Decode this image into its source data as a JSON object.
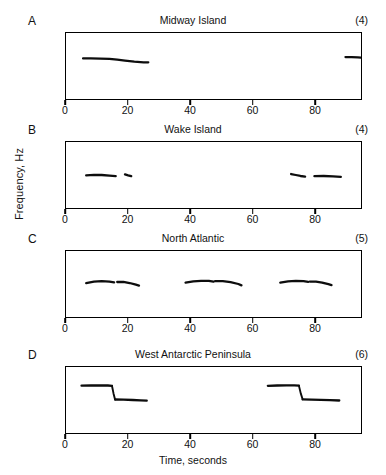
{
  "figure": {
    "y_axis_label": "Frequency, Hz",
    "x_axis_label": "Time, seconds",
    "y_ticks": [
      "0",
      "10",
      "20",
      "30",
      "40"
    ],
    "x_ticks": [
      "0",
      "20",
      "40",
      "60",
      "80"
    ],
    "panels": [
      {
        "letter": "A",
        "title": "Midway Island",
        "count": "(4)"
      },
      {
        "letter": "B",
        "title": "Wake Island",
        "count": "(4)"
      },
      {
        "letter": "C",
        "title": "North Atlantic",
        "count": "(5)"
      },
      {
        "letter": "D",
        "title": "West Antarctic Peninsula",
        "count": "(6)"
      }
    ]
  },
  "chart_data": [
    {
      "type": "line",
      "title": "Midway Island",
      "panel": "A",
      "annotation": "(4)",
      "xlabel": "Time, seconds",
      "ylabel": "Frequency, Hz",
      "xlim": [
        0,
        95
      ],
      "ylim": [
        0,
        40
      ],
      "xticks": [
        0,
        20,
        40,
        60,
        80
      ],
      "yticks": [
        0,
        10,
        20,
        30,
        40
      ],
      "grid": false,
      "legend": "none",
      "series": [
        {
          "name": "call-1",
          "x": [
            5.5,
            8.0,
            11.0,
            14.0,
            16.5,
            19.0,
            22.0,
            25.0,
            26.5
          ],
          "y": [
            24.6,
            24.6,
            24.5,
            24.3,
            23.8,
            23.2,
            22.6,
            22.2,
            22.2
          ]
        },
        {
          "name": "call-2",
          "x": [
            90.0,
            92.0,
            94.0,
            95.0
          ],
          "y": [
            25.4,
            25.4,
            25.2,
            25.1
          ]
        }
      ]
    },
    {
      "type": "line",
      "title": "Wake Island",
      "panel": "B",
      "annotation": "(4)",
      "xlabel": "Time, seconds",
      "ylabel": "Frequency, Hz",
      "xlim": [
        0,
        95
      ],
      "ylim": [
        0,
        40
      ],
      "xticks": [
        0,
        20,
        40,
        60,
        80
      ],
      "yticks": [
        0,
        10,
        20,
        30,
        40
      ],
      "grid": false,
      "legend": "none",
      "series": [
        {
          "name": "call-1",
          "x": [
            6.5,
            9.0,
            11.5,
            14.0,
            16.0
          ],
          "y": [
            19.8,
            20.1,
            20.0,
            19.6,
            19.3
          ]
        },
        {
          "name": "call-2",
          "x": [
            19.0,
            20.0,
            21.0
          ],
          "y": [
            20.4,
            19.8,
            19.3
          ]
        },
        {
          "name": "call-3",
          "x": [
            72.5,
            74.0,
            75.5,
            77.0
          ],
          "y": [
            20.6,
            20.0,
            19.4,
            19.0
          ]
        },
        {
          "name": "call-4",
          "x": [
            80.0,
            83.0,
            86.0,
            88.5
          ],
          "y": [
            19.3,
            19.4,
            19.2,
            18.9
          ]
        }
      ]
    },
    {
      "type": "line",
      "title": "North Atlantic",
      "panel": "C",
      "annotation": "(5)",
      "xlabel": "Time, seconds",
      "ylabel": "Frequency, Hz",
      "xlim": [
        0,
        95
      ],
      "ylim": [
        0,
        40
      ],
      "xticks": [
        0,
        20,
        40,
        60,
        80
      ],
      "yticks": [
        0,
        10,
        20,
        30,
        40
      ],
      "grid": false,
      "legend": "none",
      "series": [
        {
          "name": "call-1a",
          "x": [
            6.5,
            9.0,
            11.5,
            14.0,
            15.5
          ],
          "y": [
            20.6,
            21.4,
            21.7,
            21.5,
            21.0
          ]
        },
        {
          "name": "call-1b",
          "x": [
            16.5,
            18.5,
            20.5,
            22.5,
            23.5
          ],
          "y": [
            21.2,
            21.3,
            20.6,
            19.6,
            19.0
          ]
        },
        {
          "name": "call-2a",
          "x": [
            38.5,
            41.0,
            43.5,
            46.0,
            47.5
          ],
          "y": [
            20.8,
            21.6,
            21.9,
            21.9,
            21.4
          ]
        },
        {
          "name": "call-2b",
          "x": [
            48.0,
            50.5,
            53.0,
            55.5,
            56.5
          ],
          "y": [
            21.7,
            21.7,
            21.1,
            20.0,
            19.2
          ]
        },
        {
          "name": "call-3a",
          "x": [
            69.0,
            71.5,
            74.0,
            76.5,
            78.0
          ],
          "y": [
            20.8,
            21.6,
            21.9,
            21.8,
            21.3
          ]
        },
        {
          "name": "call-3b",
          "x": [
            78.5,
            80.5,
            82.5,
            84.5,
            85.5
          ],
          "y": [
            21.5,
            21.5,
            20.9,
            19.9,
            19.3
          ]
        }
      ]
    },
    {
      "type": "line",
      "title": "West Antarctic Peninsula",
      "panel": "D",
      "annotation": "(6)",
      "xlabel": "Time, seconds",
      "ylabel": "Frequency, Hz",
      "xlim": [
        0,
        95
      ],
      "ylim": [
        0,
        40
      ],
      "xticks": [
        0,
        20,
        40,
        60,
        80
      ],
      "yticks": [
        0,
        10,
        20,
        30,
        40
      ],
      "grid": false,
      "legend": "none",
      "series": [
        {
          "name": "call-1-upper",
          "x": [
            5.0,
            8.0,
            11.0,
            13.5,
            14.8
          ],
          "y": [
            28.7,
            28.8,
            28.9,
            28.8,
            28.6
          ]
        },
        {
          "name": "call-1-sweep",
          "x": [
            14.8,
            15.3,
            15.8
          ],
          "y": [
            28.6,
            24.0,
            20.3
          ]
        },
        {
          "name": "call-1-lower",
          "x": [
            15.8,
            18.5,
            21.5,
            24.0,
            26.0
          ],
          "y": [
            20.3,
            20.2,
            20.0,
            19.8,
            19.6
          ]
        },
        {
          "name": "call-2-upper",
          "x": [
            65.0,
            68.0,
            71.0,
            73.5,
            75.0
          ],
          "y": [
            28.6,
            28.8,
            28.9,
            28.9,
            28.7
          ]
        },
        {
          "name": "call-2-sweep",
          "x": [
            75.0,
            75.6,
            76.2
          ],
          "y": [
            28.7,
            24.0,
            20.4
          ]
        },
        {
          "name": "call-2-lower",
          "x": [
            76.2,
            79.0,
            82.0,
            85.0,
            88.0
          ],
          "y": [
            20.4,
            20.2,
            20.1,
            19.9,
            19.7
          ]
        }
      ]
    }
  ]
}
